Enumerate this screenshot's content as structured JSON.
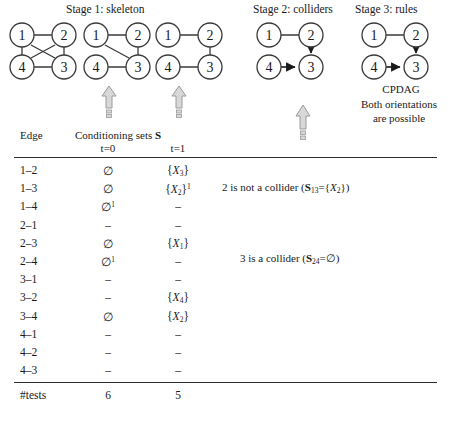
{
  "stages": [
    {
      "label": "Stage 1: skeleton"
    },
    {
      "label": "Stage 2: colliders"
    },
    {
      "label": "Stage 3: rules"
    }
  ],
  "graphs": [
    {
      "name": "skeleton-complete",
      "nodes": [
        "1",
        "2",
        "4",
        "3"
      ]
    },
    {
      "name": "skeleton-step1",
      "nodes": [
        "1",
        "2",
        "4",
        "3"
      ]
    },
    {
      "name": "skeleton-step2",
      "nodes": [
        "1",
        "2",
        "4",
        "3"
      ]
    },
    {
      "name": "colliders-graph",
      "nodes": [
        "1",
        "2",
        "4",
        "3"
      ]
    },
    {
      "name": "cpdag-graph",
      "nodes": [
        "1",
        "2",
        "4",
        "3"
      ]
    }
  ],
  "cpdag_caption": "CPDAG",
  "orientation_note_line1": "Both orientations",
  "orientation_note_line2": "are possible",
  "table": {
    "header_edge": "Edge",
    "header_conditioning": "Conditioning sets",
    "header_conditioning_symbol": "S",
    "subheader_t0": "t=0",
    "subheader_t1": "t=1",
    "rows": [
      {
        "edge": "1–2",
        "t0": "∅",
        "t0_sup": "",
        "t1_type": "set",
        "t1_var": "X",
        "t1_sub": "3",
        "t1_sup": ""
      },
      {
        "edge": "1–3",
        "t0": "∅",
        "t0_sup": "",
        "t1_type": "set",
        "t1_var": "X",
        "t1_sub": "2",
        "t1_sup": "1"
      },
      {
        "edge": "1–4",
        "t0": "∅",
        "t0_sup": "1",
        "t1_type": "dash",
        "t1_var": "",
        "t1_sub": "",
        "t1_sup": ""
      },
      {
        "edge": "2–1",
        "t0": "–",
        "t0_sup": "",
        "t1_type": "dash",
        "t1_var": "",
        "t1_sub": "",
        "t1_sup": ""
      },
      {
        "edge": "2–3",
        "t0": "∅",
        "t0_sup": "",
        "t1_type": "set",
        "t1_var": "X",
        "t1_sub": "1",
        "t1_sup": ""
      },
      {
        "edge": "2–4",
        "t0": "∅",
        "t0_sup": "1",
        "t1_type": "dash",
        "t1_var": "",
        "t1_sub": "",
        "t1_sup": ""
      },
      {
        "edge": "3–1",
        "t0": "–",
        "t0_sup": "",
        "t1_type": "dash",
        "t1_var": "",
        "t1_sub": "",
        "t1_sup": ""
      },
      {
        "edge": "3–2",
        "t0": "–",
        "t0_sup": "",
        "t1_type": "set",
        "t1_var": "X",
        "t1_sub": "4",
        "t1_sup": ""
      },
      {
        "edge": "3–4",
        "t0": "∅",
        "t0_sup": "",
        "t1_type": "set",
        "t1_var": "X",
        "t1_sub": "2",
        "t1_sup": ""
      },
      {
        "edge": "4–1",
        "t0": "–",
        "t0_sup": "",
        "t1_type": "dash",
        "t1_var": "",
        "t1_sub": "",
        "t1_sup": ""
      },
      {
        "edge": "4–2",
        "t0": "–",
        "t0_sup": "",
        "t1_type": "dash",
        "t1_var": "",
        "t1_sub": "",
        "t1_sup": ""
      },
      {
        "edge": "4–3",
        "t0": "–",
        "t0_sup": "",
        "t1_type": "dash",
        "t1_var": "",
        "t1_sub": "",
        "t1_sup": ""
      }
    ],
    "footer_label": "#tests",
    "footer_t0": "6",
    "footer_t1": "5"
  },
  "annotations": {
    "note1_prefix": "2 is not a collider (",
    "note1_s": "S",
    "note1_s_sub": "13",
    "note1_eq": "={",
    "note1_var": "X",
    "note1_var_sub": "2",
    "note1_suffix": "})",
    "note2_prefix": "3 is a collider (",
    "note2_s": "S",
    "note2_s_sub": "24",
    "note2_eq": "=∅)",
    "note2_suffix": ""
  },
  "colors": {
    "ink": "#1a1a1a",
    "node_stroke": "#3a3a3a",
    "arrow_fill": "#d4d4d4",
    "arrow_stroke": "#9a9a9a"
  }
}
